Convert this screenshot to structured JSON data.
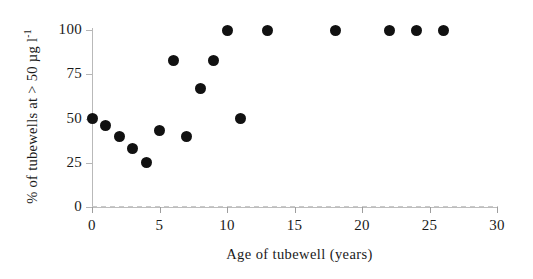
{
  "chart_data": {
    "type": "scatter",
    "title": "",
    "xlabel": "Age of tubewell (years)",
    "ylabel": "% of tubewells at > 50 µg l⁻¹",
    "ylabel_main": "% of tubewells at  > 50 µg l",
    "ylabel_sup": "-1",
    "xlim": [
      0,
      30
    ],
    "ylim": [
      0,
      100
    ],
    "xticks": [
      0,
      5,
      10,
      15,
      20,
      25,
      30
    ],
    "yticks": [
      0,
      25,
      50,
      75,
      100
    ],
    "xtick_labels": [
      "0",
      "5",
      "10",
      "15",
      "20",
      "25",
      "30"
    ],
    "ytick_labels": [
      "0",
      "25",
      "50",
      "75",
      "100"
    ],
    "grid": false,
    "legend": false,
    "marker": "filled-circle",
    "marker_color": "#111111",
    "axis_color": "#b9b9b9",
    "x": [
      0,
      1,
      2,
      3,
      4,
      5,
      6,
      7,
      8,
      9,
      10,
      11,
      13,
      18,
      22,
      24,
      26
    ],
    "y": [
      50,
      46,
      40,
      33,
      25,
      43,
      83,
      40,
      67,
      83,
      100,
      50,
      100,
      100,
      100,
      100,
      100
    ],
    "points": [
      {
        "x": 0,
        "y": 50
      },
      {
        "x": 1,
        "y": 46
      },
      {
        "x": 2,
        "y": 40
      },
      {
        "x": 3,
        "y": 33
      },
      {
        "x": 4,
        "y": 25
      },
      {
        "x": 5,
        "y": 43
      },
      {
        "x": 6,
        "y": 83
      },
      {
        "x": 7,
        "y": 40
      },
      {
        "x": 8,
        "y": 67
      },
      {
        "x": 9,
        "y": 83
      },
      {
        "x": 10,
        "y": 100
      },
      {
        "x": 11,
        "y": 50
      },
      {
        "x": 13,
        "y": 100
      },
      {
        "x": 18,
        "y": 100
      },
      {
        "x": 22,
        "y": 100
      },
      {
        "x": 24,
        "y": 100
      },
      {
        "x": 26,
        "y": 100
      }
    ]
  }
}
